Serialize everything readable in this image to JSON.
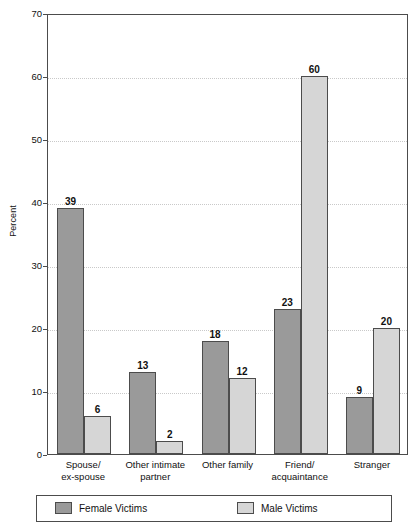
{
  "chart_data": {
    "type": "bar",
    "title": "",
    "xlabel": "",
    "ylabel": "Percent",
    "ylim": [
      0,
      70
    ],
    "yticks": [
      0,
      10,
      20,
      30,
      40,
      50,
      60,
      70
    ],
    "grid": "horizontal-dotted",
    "legend_position": "bottom",
    "categories": [
      "Spouse/ ex-spouse",
      "Other intimate partner",
      "Other family",
      "Friend/ acquaintance",
      "Stranger"
    ],
    "category_lines": [
      [
        "Spouse/",
        "ex-spouse"
      ],
      [
        "Other intimate",
        "partner"
      ],
      [
        "Other family",
        ""
      ],
      [
        "Friend/",
        "acquaintance"
      ],
      [
        "Stranger",
        ""
      ]
    ],
    "series": [
      {
        "name": "Female Victims",
        "color": "#9a9a9a",
        "values": [
          39,
          13,
          18,
          23,
          9
        ]
      },
      {
        "name": "Male Victims",
        "color": "#d6d6d6",
        "values": [
          6,
          2,
          12,
          60,
          20
        ]
      }
    ]
  },
  "axis": {
    "y_title": "Percent",
    "y_tick_labels": [
      "70",
      "60",
      "50",
      "40",
      "30",
      "20",
      "10",
      "0"
    ]
  },
  "legend": {
    "items": [
      {
        "label": "Female Victims",
        "swatch": "female"
      },
      {
        "label": "Male Victims",
        "swatch": "male"
      }
    ]
  },
  "colors": {
    "female": "#9a9a9a",
    "male": "#d6d6d6",
    "axis": "#4c4c4c",
    "grid": "#c9c9c9"
  }
}
